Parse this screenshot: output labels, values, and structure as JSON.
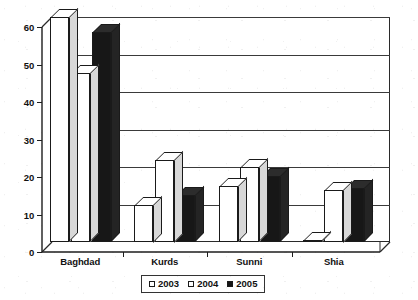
{
  "chart_data": {
    "type": "bar",
    "title": "Annual percentage",
    "xlabel": "",
    "ylabel": "",
    "ylim": [
      0,
      60
    ],
    "yticks": [
      0,
      10,
      20,
      30,
      40,
      50,
      60
    ],
    "ytick_labels": [
      "0",
      "10",
      "20",
      "30",
      "40",
      "50",
      "60"
    ],
    "categories": [
      "Baghdad",
      "Kurds",
      "Sunni",
      "Shia"
    ],
    "grid": true,
    "legend_position": "bottom",
    "style": "3d-grouped-bars",
    "series": [
      {
        "name": "2003",
        "color": "#ffffff",
        "values": [
          60,
          10,
          15,
          0.5
        ]
      },
      {
        "name": "2004",
        "color": "#ffffff",
        "values": [
          45,
          22,
          20,
          14
        ]
      },
      {
        "name": "2005",
        "color": "#151515",
        "values": [
          56,
          12.5,
          17.5,
          14.5
        ]
      }
    ]
  },
  "title_box": {
    "text": "Annual percentage"
  },
  "legend": {
    "items": [
      {
        "label": "2003",
        "swatch": "light"
      },
      {
        "label": "2004",
        "swatch": "light"
      },
      {
        "label": "2005",
        "swatch": "dark"
      }
    ]
  },
  "axis": {
    "y_labels": [
      "60",
      "50",
      "40",
      "30",
      "20",
      "10",
      "0"
    ],
    "x_labels": [
      "Baghdad",
      "Kurds",
      "Sunni",
      "Shia"
    ]
  }
}
